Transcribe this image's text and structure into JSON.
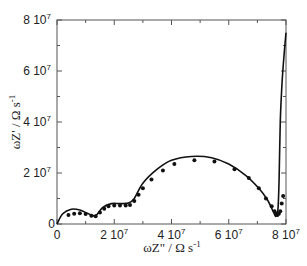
{
  "chart_data": {
    "type": "scatter",
    "title": "",
    "xlabel": "ωZ\" / Ω s-1",
    "ylabel": "ωZ' / Ω s-1",
    "xlim": [
      0,
      80000000
    ],
    "ylim": [
      0,
      80000000
    ],
    "grid": false,
    "legend": "none",
    "x_ticks": [
      0,
      20000000,
      40000000,
      60000000,
      80000000
    ],
    "x_tick_labels": [
      "0",
      "2 10^7",
      "4 10^7",
      "6 10^7",
      "8 10^7"
    ],
    "y_ticks": [
      0,
      20000000,
      40000000,
      60000000,
      80000000
    ],
    "y_tick_labels": [
      "0",
      "2 10^7",
      "4 10^7",
      "6 10^7",
      "8 10^7"
    ],
    "series": [
      {
        "name": "experimental",
        "style": "markers",
        "x": [
          4000000,
          6000000,
          8000000,
          10000000,
          12000000,
          13500000,
          15000000,
          16500000,
          18000000,
          20000000,
          22000000,
          24000000,
          25500000,
          27000000,
          28500000,
          30000000,
          33000000,
          37000000,
          41000000,
          48000000,
          55000000,
          62000000,
          67000000,
          70500000,
          73000000,
          75000000,
          76000000,
          76500000,
          77000000,
          77500000,
          78000000,
          78500000,
          79000000
        ],
        "y": [
          3500000,
          4000000,
          4200000,
          3900000,
          3200000,
          3000000,
          4500000,
          6000000,
          7000000,
          7300000,
          7300000,
          7300000,
          7500000,
          9000000,
          11500000,
          14000000,
          17500000,
          21000000,
          23500000,
          25000000,
          24500000,
          21500000,
          18000000,
          14000000,
          10000000,
          7000000,
          5000000,
          4000000,
          3500000,
          4000000,
          5000000,
          8000000,
          11000000
        ]
      },
      {
        "name": "fit",
        "style": "line",
        "x": [
          0,
          2000000,
          5000000,
          8000000,
          11000000,
          13500000,
          16000000,
          19000000,
          22000000,
          25000000,
          27000000,
          30000000,
          35000000,
          40000000,
          47000000,
          54000000,
          60000000,
          66000000,
          70500000,
          73500000,
          75500000,
          76500000,
          77200000,
          77600000,
          78000000,
          78600000,
          79300000,
          80000000
        ],
        "y": [
          0,
          4000000,
          5800000,
          5500000,
          4000000,
          3300000,
          6500000,
          8000000,
          8000000,
          8200000,
          10000000,
          16000000,
          21500000,
          25000000,
          26500000,
          26000000,
          23500000,
          19000000,
          14000000,
          9500000,
          5000000,
          3000000,
          6000000,
          18000000,
          40000000,
          55000000,
          66000000,
          75000000
        ]
      }
    ]
  },
  "labels": {
    "x_axis_title_main": "ωZ\" / Ω s",
    "x_axis_title_sup": "-1",
    "y_axis_title_main": "ωZ' / Ω s",
    "y_axis_title_sup": "-1",
    "tick_base": "10",
    "tick_exp": "7",
    "x_tick_mantissas": [
      "0",
      "2",
      "4",
      "6",
      "8"
    ],
    "y_tick_mantissas": [
      "0",
      "2",
      "4",
      "6",
      "8"
    ]
  },
  "colors": {
    "axis": "#555555",
    "data": "#111111",
    "background": "#ffffff"
  }
}
